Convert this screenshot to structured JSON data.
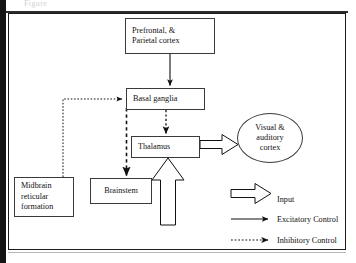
{
  "page": {
    "caption_ghost": "Figure",
    "frame_color": "#1c1c1c",
    "background": "#ffffff",
    "ink_color": "#111111"
  },
  "diagram": {
    "nodes": [
      {
        "id": "prefrontal",
        "shape": "rect",
        "label_lines": [
          "Prefrontal, &",
          "Parietal cortex"
        ]
      },
      {
        "id": "basal",
        "shape": "rect",
        "label_lines": [
          "Basal ganglia"
        ]
      },
      {
        "id": "thalamus",
        "shape": "rect",
        "label_lines": [
          "Thalamus"
        ]
      },
      {
        "id": "brainstem",
        "shape": "rect",
        "label_lines": [
          "Brainstem"
        ]
      },
      {
        "id": "midbrain",
        "shape": "rect",
        "label_lines": [
          "Midbrain",
          "reticular",
          "formation"
        ]
      },
      {
        "id": "cortex",
        "shape": "ellipse",
        "label_lines": [
          "Visual &",
          "auditory",
          "cortex"
        ]
      }
    ],
    "edges": [
      {
        "from": "prefrontal",
        "to": "basal",
        "type": "excitatory"
      },
      {
        "from": "basal",
        "to": "thalamus",
        "type": "inhibitory"
      },
      {
        "from": "basal",
        "to": "brainstem",
        "type": "inhibitory"
      },
      {
        "from": "midbrain",
        "to": "basal",
        "type": "inhibitory"
      },
      {
        "from": "thalamus",
        "to": "cortex",
        "type": "input"
      },
      {
        "from": "external",
        "to": "thalamus",
        "type": "input"
      }
    ]
  },
  "legend": {
    "items": [
      {
        "key": "input",
        "label": "Input"
      },
      {
        "key": "excitatory",
        "label": "Excitatory Control"
      },
      {
        "key": "inhibitory",
        "label": "Inhibitory Control"
      }
    ]
  }
}
